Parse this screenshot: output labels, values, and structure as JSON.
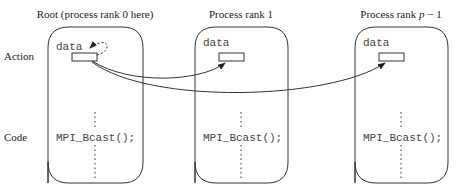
{
  "row_labels": {
    "action": "Action",
    "code": "Code"
  },
  "processes": [
    {
      "title_prefix": "Root (process rank 0 here)",
      "title_italic": "",
      "title_suffix": "",
      "variable": "data",
      "code": "MPI_Bcast();"
    },
    {
      "title_prefix": "Process rank 1",
      "title_italic": "",
      "title_suffix": "",
      "variable": "data",
      "code": "MPI_Bcast();"
    },
    {
      "title_prefix": "Process rank ",
      "title_italic": "p",
      "title_suffix": " − 1",
      "variable": "data",
      "code": "MPI_Bcast();"
    }
  ],
  "colors": {
    "stroke": "#333333",
    "text": "#222222",
    "code_text": "#444444"
  }
}
